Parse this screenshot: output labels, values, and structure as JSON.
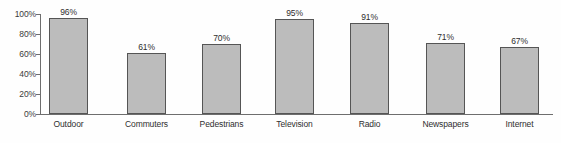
{
  "chart_data": {
    "type": "bar",
    "title": "",
    "xlabel": "",
    "ylabel": "",
    "categories": [
      "Outdoor",
      "Commuters",
      "Pedestrians",
      "Television",
      "Radio",
      "Newspapers",
      "Internet"
    ],
    "values": [
      96,
      61,
      70,
      95,
      91,
      71,
      67
    ],
    "value_labels": [
      "96%",
      "61%",
      "70%",
      "95%",
      "91%",
      "71%",
      "67%"
    ],
    "ylim": [
      0,
      100
    ],
    "ytick_values": [
      100,
      80,
      60,
      40,
      20,
      0
    ],
    "ytick_labels": [
      "100%",
      "80%",
      "60%",
      "40%",
      "20%",
      "0%"
    ],
    "grid": false,
    "legend": false,
    "orientation": "vertical",
    "bar_fill_color": "#bcbcbc",
    "bar_border_color": "#555555",
    "axis_color": "#6e6e6e",
    "text_color": "#2e2e2e",
    "background_color": "#fefefe"
  }
}
